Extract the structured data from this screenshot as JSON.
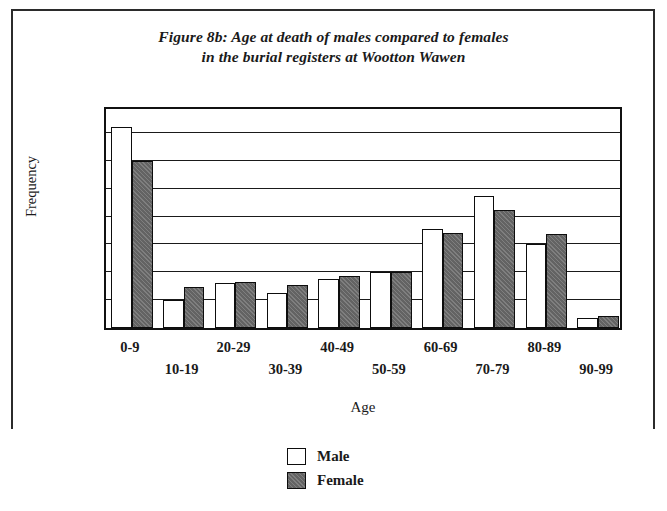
{
  "figure": {
    "title_line1": "Figure 8b: Age at death of males compared to females",
    "title_line2": "in the burial registers at Wootton Wawen"
  },
  "axis": {
    "x_title": "Age",
    "y_title": "Frequency"
  },
  "legend": {
    "items": [
      {
        "label": "Male",
        "swatch": "white-square-swatch"
      },
      {
        "label": "Female",
        "swatch": "gray-square-swatch"
      }
    ]
  },
  "colors": {
    "male_fill": "#ffffff",
    "female_fill": "#636363",
    "outline": "#0d0d0d",
    "background": "#ffffff"
  },
  "chart_data": {
    "type": "bar",
    "title": "Figure 8b: Age at death of males compared to females in the burial registers at Wootton Wawen",
    "xlabel": "Age",
    "ylabel": "Frequency",
    "ylim": [
      0,
      400
    ],
    "yticks": [
      0,
      50,
      100,
      150,
      200,
      250,
      300,
      350,
      400
    ],
    "ytick_labels": [
      "0",
      "50",
      "100",
      "150",
      "200",
      "250",
      "300",
      "350",
      "400"
    ],
    "grid": true,
    "legend_position": "bottom-center",
    "categories": [
      "0-9",
      "10-19",
      "20-29",
      "30-39",
      "40-49",
      "50-59",
      "60-69",
      "70-79",
      "80-89",
      "90-99"
    ],
    "series": [
      {
        "name": "Male",
        "values": [
          360,
          50,
          80,
          62,
          88,
          100,
          178,
          237,
          150,
          18
        ]
      },
      {
        "name": "Female",
        "values": [
          300,
          73,
          83,
          77,
          93,
          100,
          171,
          212,
          168,
          22
        ]
      }
    ]
  }
}
